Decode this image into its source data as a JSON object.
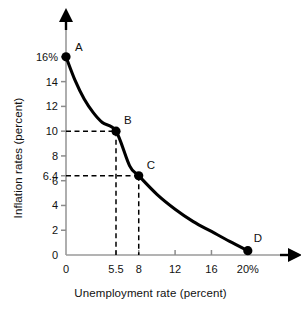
{
  "chart_data": {
    "type": "line",
    "title": "",
    "xlabel": "Unemployment rate (percent)",
    "ylabel": "Inflation rates (percent)",
    "xlim": [
      0,
      22
    ],
    "ylim": [
      0,
      17.2
    ],
    "grid": false,
    "legend": "none",
    "x_ticks": [
      {
        "value": 0,
        "label": "0"
      },
      {
        "value": 5.5,
        "label": "5.5"
      },
      {
        "value": 8,
        "label": "8"
      },
      {
        "value": 12,
        "label": "12"
      },
      {
        "value": 16,
        "label": "16"
      },
      {
        "value": 20,
        "label": "20%"
      }
    ],
    "y_ticks": [
      {
        "value": 0,
        "label": "0"
      },
      {
        "value": 2,
        "label": "2"
      },
      {
        "value": 4,
        "label": "4"
      },
      {
        "value": 6,
        "label": "6"
      },
      {
        "value": 6.4,
        "label": "6.4"
      },
      {
        "value": 8,
        "label": "8"
      },
      {
        "value": 10,
        "label": "10"
      },
      {
        "value": 12,
        "label": "12"
      },
      {
        "value": 14,
        "label": "14"
      },
      {
        "value": 16,
        "label": "16%"
      }
    ],
    "series": [
      {
        "name": "Phillips curve",
        "x": [
          0,
          1,
          2,
          3,
          4,
          5.5,
          7,
          8,
          10,
          12,
          14,
          16,
          18,
          20
        ],
        "values": [
          16,
          14.1,
          12.6,
          11.5,
          10.7,
          10.0,
          7.2,
          6.4,
          4.9,
          3.7,
          2.7,
          1.9,
          1.1,
          0.35
        ]
      }
    ],
    "points": [
      {
        "label": "A",
        "x": 0,
        "y": 16
      },
      {
        "label": "B",
        "x": 5.5,
        "y": 10
      },
      {
        "label": "C",
        "x": 8,
        "y": 6.4
      },
      {
        "label": "D",
        "x": 20,
        "y": 0.35
      }
    ],
    "guide_lines": [
      {
        "point": "B",
        "x": 5.5,
        "y": 10
      },
      {
        "point": "C",
        "x": 8,
        "y": 6.4
      }
    ]
  },
  "colors": {
    "curve": "#000000",
    "axis": "#808080",
    "tick": "#808080",
    "dashed": "#000000",
    "marker": "#000000",
    "text": "#111111",
    "background": "#ffffff"
  }
}
